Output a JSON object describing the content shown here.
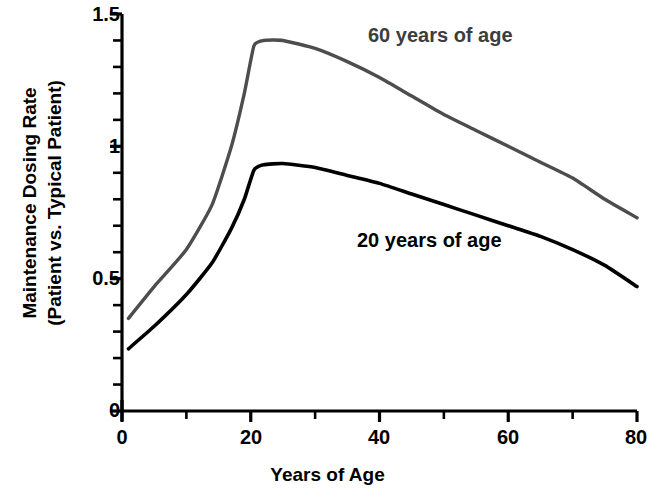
{
  "chart_data": {
    "type": "line",
    "title": "",
    "xlabel": "Years of Age",
    "ylabel": "Maintenance Dosing Rate (Patient vs. Typical Patient)",
    "ylabel_line1": "Maintenance Dosing Rate",
    "ylabel_line2": "(Patient vs. Typical Patient)",
    "xlim": [
      0,
      80
    ],
    "ylim": [
      0,
      1.5
    ],
    "grid": false,
    "legend_position": "inline-annotation",
    "x_major_ticks": [
      0,
      20,
      40,
      60,
      80
    ],
    "x_major_tick_labels": [
      "0",
      "20",
      "40",
      "60",
      "80"
    ],
    "x_minor_tick_interval": 10,
    "y_major_ticks": [
      0,
      0.5,
      1,
      1.5
    ],
    "y_major_tick_labels": [
      "0",
      "0.5",
      "1",
      "1.5"
    ],
    "y_minor_tick_interval": 0.1,
    "x": [
      1,
      5,
      10,
      14,
      17,
      19,
      20.5,
      22,
      25,
      30,
      35,
      40,
      45,
      50,
      55,
      60,
      65,
      70,
      75,
      80
    ],
    "series": [
      {
        "name": "60 years of age",
        "color": "#4d4d4d",
        "annotation": "60 years of age",
        "values": [
          0.35,
          0.47,
          0.61,
          0.78,
          1.0,
          1.2,
          1.38,
          1.4,
          1.4,
          1.37,
          1.32,
          1.26,
          1.19,
          1.12,
          1.06,
          1.0,
          0.94,
          0.88,
          0.8,
          0.73
        ]
      },
      {
        "name": "20 years of age",
        "color": "#000000",
        "annotation": "20 years of age",
        "values": [
          0.235,
          0.32,
          0.44,
          0.56,
          0.69,
          0.8,
          0.91,
          0.93,
          0.935,
          0.92,
          0.89,
          0.86,
          0.82,
          0.78,
          0.74,
          0.7,
          0.66,
          0.61,
          0.55,
          0.47
        ]
      }
    ],
    "annotations": [
      {
        "text": "60 years of age",
        "x_px": 368,
        "y_px": 33,
        "color": "#3d3d3d"
      },
      {
        "text": "20 years of age",
        "x_px": 357,
        "y_px": 238,
        "color": "#000000"
      }
    ]
  }
}
